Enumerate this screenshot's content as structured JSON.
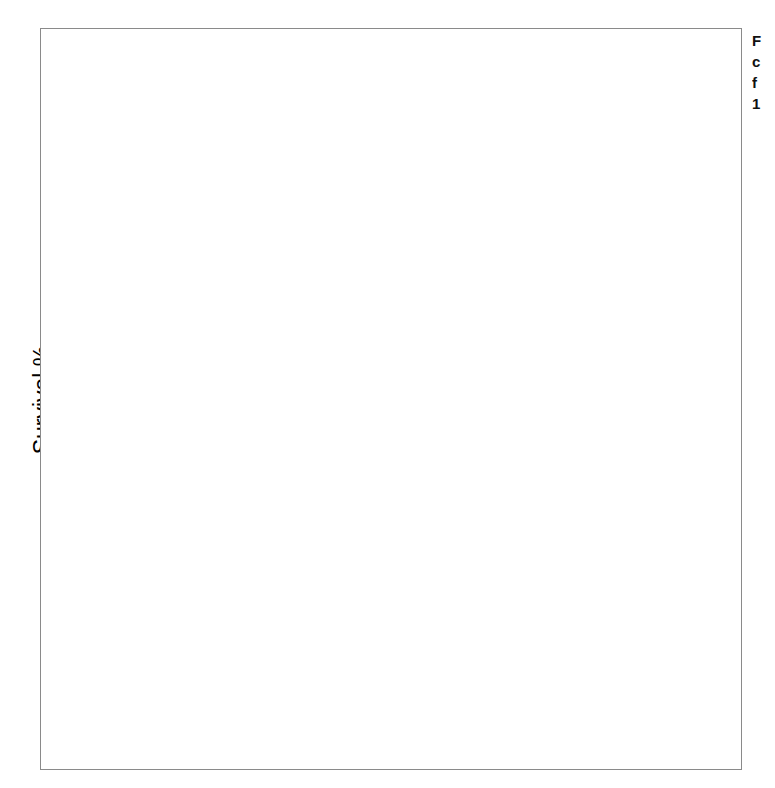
{
  "figure": {
    "caption_fragment": "F\nc\nf\n1"
  },
  "axes": {
    "y_label": "Survival %",
    "x_label": "Years after fracture",
    "y_ticks": [
      0,
      20,
      40,
      60,
      80,
      100
    ],
    "x_ticks": [
      0,
      1,
      2,
      3,
      4,
      5
    ],
    "ylim": [
      0,
      100
    ],
    "xlim": [
      0,
      5
    ]
  },
  "legend": {
    "position": "panel-1-bottom-right",
    "entries": [
      {
        "label": "Expected",
        "style": "dashed"
      },
      {
        "label": "Observed",
        "style": "solid"
      }
    ]
  },
  "panels": [
    {
      "key": "vertebral",
      "label": "Vertebral"
    },
    {
      "key": "hip",
      "label": "Hip"
    },
    {
      "key": "distal_forearm",
      "label": "Distal forearm"
    }
  ],
  "chart_data": {
    "type": "line",
    "xlabel": "Years after fracture",
    "ylabel": "Survival %",
    "xlim": [
      0,
      5
    ],
    "ylim": [
      0,
      100
    ],
    "grid": false,
    "legend_position": "upper panel, lower right",
    "panels": [
      {
        "name": "Vertebral",
        "series": [
          {
            "name": "Expected",
            "style": "dashed",
            "x": [
              0,
              0.5,
              1,
              1.5,
              2,
              2.5,
              3,
              3.5,
              4,
              4.5,
              5
            ],
            "y": [
              100,
              97.8,
              95.6,
              93.5,
              91.3,
              89.2,
              87.0,
              84.8,
              82.5,
              79.8,
              76.4
            ]
          },
          {
            "name": "Observed",
            "style": "solid",
            "x": [
              0,
              0.2,
              0.45,
              0.7,
              0.9,
              1.1,
              1.35,
              1.5,
              1.75,
              2.0,
              2.25,
              2.45,
              2.7,
              2.9,
              3.1,
              3.3,
              3.5,
              3.7,
              3.9,
              4.2,
              4.5,
              4.7,
              5.0
            ],
            "y": [
              100,
              98.6,
              97.2,
              96.0,
              94.6,
              93.4,
              92.6,
              90.4,
              89.4,
              88.6,
              87.4,
              86.2,
              84.4,
              84.0,
              82.0,
              81.2,
              80.4,
              78.4,
              77.6,
              74.6,
              69.2,
              68.8,
              64.8
            ]
          }
        ]
      },
      {
        "name": "Hip",
        "series": [
          {
            "name": "Expected",
            "style": "dashed",
            "x": [
              0,
              0.5,
              1,
              1.5,
              2,
              2.5,
              3,
              3.5,
              4,
              4.5,
              5
            ],
            "y": [
              100,
              96.2,
              92.4,
              88.8,
              85.2,
              81.8,
              78.4,
              75.0,
              71.4,
              67.2,
              62.4
            ]
          },
          {
            "name": "Observed",
            "style": "solid",
            "x": [
              0,
              0.1,
              0.25,
              0.5,
              0.75,
              1.0,
              1.3,
              1.6,
              1.9,
              2.2,
              2.5,
              2.8,
              3.0,
              3.3,
              3.6,
              3.9,
              4.1,
              4.35,
              4.6,
              4.8,
              5.0
            ],
            "y": [
              100,
              92.0,
              88.6,
              85.4,
              83.2,
              81.0,
              78.4,
              76.2,
              73.8,
              71.6,
              69.2,
              66.0,
              65.0,
              63.0,
              61.0,
              59.0,
              57.6,
              56.0,
              54.2,
              53.0,
              52.2
            ]
          }
        ]
      },
      {
        "name": "Distal forearm",
        "series": [
          {
            "name": "Expected",
            "style": "dashed",
            "x": [
              0,
              0.5,
              1,
              1.5,
              2,
              2.5,
              3,
              3.5,
              4,
              4.5,
              5
            ],
            "y": [
              100,
              99.0,
              98.0,
              96.8,
              95.6,
              94.4,
              93.2,
              92.2,
              91.2,
              90.2,
              89.0
            ]
          },
          {
            "name": "Observed",
            "style": "solid",
            "x": [
              0,
              0.4,
              0.8,
              1.2,
              1.6,
              2.0,
              2.5,
              3.0,
              3.5,
              3.62,
              3.7,
              4.2,
              5.0
            ],
            "y": [
              100,
              99.6,
              99.2,
              98.8,
              98.2,
              97.6,
              97.0,
              96.4,
              96.0,
              95.8,
              93.4,
              93.2,
              92.8
            ]
          }
        ]
      }
    ]
  }
}
